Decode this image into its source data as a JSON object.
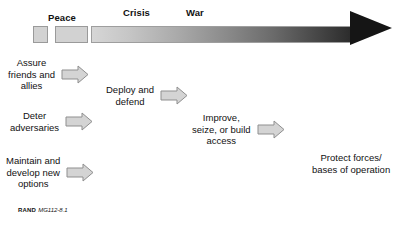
{
  "figure": {
    "spectrum": {
      "labels": [
        {
          "text": "Peace",
          "left": 48,
          "top": 12
        },
        {
          "text": "Crisis",
          "left": 123,
          "top": 7
        },
        {
          "text": "War",
          "left": 186,
          "top": 7
        }
      ],
      "segments": [
        {
          "name": "peace-segment-small"
        },
        {
          "name": "peace-segment-wide"
        }
      ],
      "gradient": {
        "from_color": "#d6d6d6",
        "to_color": "#2b2b2b"
      },
      "arrow_color": "#151515"
    },
    "stages": [
      {
        "id": "assure-friends-and-allies",
        "text": "Assure\nfriends and\nallies",
        "left": 8,
        "top": 57,
        "has_arrow": true
      },
      {
        "id": "deploy-and-defend",
        "text": "Deploy and\ndefend",
        "left": 106,
        "top": 84,
        "has_arrow": true
      },
      {
        "id": "deter-adversaries",
        "text": "Deter\nadversaries",
        "left": 10,
        "top": 110,
        "has_arrow": true
      },
      {
        "id": "improve-seize-or-build-access",
        "text": "Improve,\nseize, or build\naccess",
        "left": 192,
        "top": 112,
        "has_arrow": true
      },
      {
        "id": "maintain-and-develop-new-options",
        "text": "Maintain and\ndevelop new\noptions",
        "left": 6,
        "top": 155,
        "has_arrow": true
      },
      {
        "id": "protect-forces-bases-of-operation",
        "text": "Protect forces/\nbases of operation",
        "left": 312,
        "top": 152,
        "has_arrow": false
      }
    ],
    "credit": {
      "organization": "RAND",
      "identifier": "MG112-8.1"
    }
  }
}
